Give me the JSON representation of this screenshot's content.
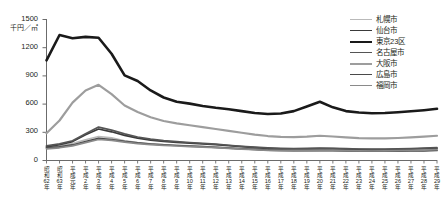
{
  "chart_data": {
    "type": "line",
    "title": "",
    "subtitle": "",
    "xlabel": "",
    "ylabel": "千円／㎡",
    "ylim": [
      0,
      1500
    ],
    "y_ticks": [
      0,
      300,
      600,
      900,
      1200,
      1500
    ],
    "y_tick_labels": [
      "0",
      "300",
      "600",
      "900",
      "1200",
      "1500"
    ],
    "grid": false,
    "legend_position": "right",
    "categories": [
      "昭和62年",
      "昭和63年",
      "平成元年",
      "平成2年",
      "平成3年",
      "平成4年",
      "平成5年",
      "平成6年",
      "平成7年",
      "平成8年",
      "平成9年",
      "平成10年",
      "平成11年",
      "平成12年",
      "平成13年",
      "平成14年",
      "平成15年",
      "平成16年",
      "平成17年",
      "平成18年",
      "平成19年",
      "平成20年",
      "平成21年",
      "平成22年",
      "平成23年",
      "平成24年",
      "平成25年",
      "平成26年",
      "平成27年",
      "平成28年",
      "平成29年"
    ],
    "category_lines": [
      [
        "昭",
        "和",
        "62",
        "年"
      ],
      [
        "昭",
        "和",
        "63",
        "年"
      ],
      [
        "平",
        "成",
        "元",
        "年"
      ],
      [
        "平",
        "成",
        "2",
        "年"
      ],
      [
        "平",
        "成",
        "3",
        "年"
      ],
      [
        "平",
        "成",
        "4",
        "年"
      ],
      [
        "平",
        "成",
        "5",
        "年"
      ],
      [
        "平",
        "成",
        "6",
        "年"
      ],
      [
        "平",
        "成",
        "7",
        "年"
      ],
      [
        "平",
        "成",
        "8",
        "年"
      ],
      [
        "平",
        "成",
        "9",
        "年"
      ],
      [
        "平",
        "成",
        "10",
        "年"
      ],
      [
        "平",
        "成",
        "11",
        "年"
      ],
      [
        "平",
        "成",
        "12",
        "年"
      ],
      [
        "平",
        "成",
        "13",
        "年"
      ],
      [
        "平",
        "成",
        "14",
        "年"
      ],
      [
        "平",
        "成",
        "15",
        "年"
      ],
      [
        "平",
        "成",
        "16",
        "年"
      ],
      [
        "平",
        "成",
        "17",
        "年"
      ],
      [
        "平",
        "成",
        "18",
        "年"
      ],
      [
        "平",
        "成",
        "19",
        "年"
      ],
      [
        "平",
        "成",
        "20",
        "年"
      ],
      [
        "平",
        "成",
        "21",
        "年"
      ],
      [
        "平",
        "成",
        "22",
        "年"
      ],
      [
        "平",
        "成",
        "23",
        "年"
      ],
      [
        "平",
        "成",
        "24",
        "年"
      ],
      [
        "平",
        "成",
        "25",
        "年"
      ],
      [
        "平",
        "成",
        "26",
        "年"
      ],
      [
        "平",
        "成",
        "27",
        "年"
      ],
      [
        "平",
        "成",
        "28",
        "年"
      ],
      [
        "平",
        "成",
        "29",
        "年"
      ]
    ],
    "series": [
      {
        "name": "札幌市",
        "color": "#b9b9b9",
        "width": 1.7,
        "values": [
          130,
          150,
          175,
          215,
          250,
          235,
          205,
          185,
          172,
          163,
          157,
          150,
          143,
          136,
          128,
          120,
          112,
          106,
          102,
          100,
          101,
          104,
          103,
          100,
          98,
          97,
          97,
          98,
          100,
          103,
          107
        ]
      },
      {
        "name": "仙台市",
        "color": "#3a3a3a",
        "width": 1.7,
        "values": [
          140,
          162,
          196,
          268,
          330,
          300,
          262,
          232,
          212,
          198,
          188,
          180,
          172,
          163,
          152,
          142,
          132,
          124,
          119,
          117,
          118,
          122,
          120,
          116,
          113,
          111,
          111,
          113,
          116,
          120,
          125
        ]
      },
      {
        "name": "東京23区",
        "color": "#1a1a1a",
        "width": 2.6,
        "values": [
          1060,
          1330,
          1295,
          1310,
          1300,
          1130,
          900,
          840,
          740,
          665,
          620,
          600,
          575,
          555,
          540,
          520,
          500,
          490,
          495,
          520,
          570,
          620,
          560,
          520,
          505,
          498,
          500,
          508,
          518,
          530,
          545
        ]
      },
      {
        "name": "名古屋市",
        "color": "#555555",
        "width": 1.7,
        "values": [
          150,
          172,
          205,
          280,
          350,
          318,
          278,
          245,
          222,
          207,
          196,
          186,
          177,
          168,
          157,
          146,
          136,
          128,
          123,
          121,
          123,
          127,
          124,
          120,
          117,
          116,
          116,
          118,
          121,
          126,
          131
        ]
      },
      {
        "name": "大阪市",
        "color": "#9d9d9d",
        "width": 2.2,
        "values": [
          285,
          420,
          610,
          740,
          800,
          700,
          580,
          510,
          455,
          415,
          390,
          370,
          350,
          330,
          310,
          290,
          270,
          255,
          246,
          243,
          248,
          258,
          250,
          240,
          233,
          230,
          230,
          234,
          240,
          248,
          258
        ]
      },
      {
        "name": "広島市",
        "color": "#4a4a4a",
        "width": 1.7,
        "values": [
          128,
          140,
          160,
          195,
          230,
          218,
          198,
          182,
          170,
          161,
          154,
          148,
          142,
          135,
          127,
          119,
          112,
          106,
          102,
          100,
          100,
          102,
          100,
          97,
          95,
          93,
          93,
          94,
          96,
          98,
          101
        ]
      },
      {
        "name": "福岡市",
        "color": "#8a8a8a",
        "width": 1.7,
        "values": [
          118,
          130,
          150,
          185,
          218,
          208,
          190,
          175,
          164,
          156,
          149,
          143,
          137,
          131,
          123,
          116,
          109,
          103,
          100,
          99,
          100,
          103,
          101,
          99,
          97,
          96,
          97,
          99,
          102,
          106,
          111
        ]
      }
    ]
  },
  "axes": {
    "unit_label": "千円／㎡"
  }
}
